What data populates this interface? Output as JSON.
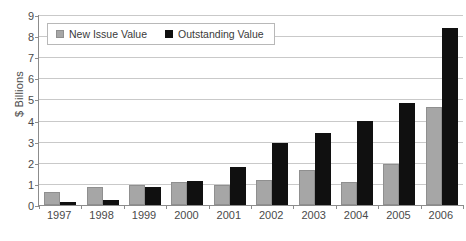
{
  "chart_data": {
    "type": "bar",
    "title": "",
    "xlabel": "",
    "ylabel": "$ Billions",
    "ylim": [
      0,
      9
    ],
    "ytick_values": [
      0,
      1,
      2,
      3,
      4,
      5,
      6,
      7,
      8,
      9
    ],
    "ytick_labels": [
      "0",
      "1",
      "2",
      "3",
      "4",
      "5",
      "6",
      "7",
      "8",
      "9"
    ],
    "grid": true,
    "legend_position": "top-left",
    "categories": [
      "1997",
      "1998",
      "1999",
      "2000",
      "2001",
      "2002",
      "2003",
      "2004",
      "2005",
      "2006"
    ],
    "series": [
      {
        "name": "New Issue Value",
        "color": "#a6a6a6",
        "values": [
          0.62,
          0.84,
          0.97,
          1.1,
          0.95,
          1.19,
          1.67,
          1.09,
          1.95,
          4.64
        ]
      },
      {
        "name": "Outstanding Value",
        "color": "#101010",
        "values": [
          0.16,
          0.24,
          0.87,
          1.12,
          1.8,
          2.93,
          3.42,
          4.0,
          4.84,
          8.4
        ]
      }
    ]
  },
  "caption": ""
}
